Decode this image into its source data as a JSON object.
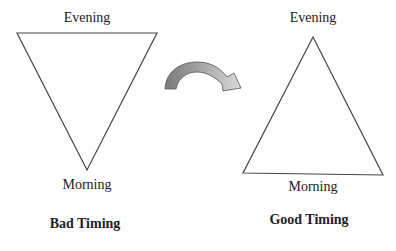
{
  "diagram": {
    "left": {
      "top_label": "Evening",
      "bottom_label": "Morning",
      "caption": "Bad Timing",
      "shape": "inverted-triangle"
    },
    "right": {
      "top_label": "Evening",
      "bottom_label": "Morning",
      "caption": "Good Timing",
      "shape": "upright-triangle"
    },
    "connector": {
      "icon": "curved-arrow-right",
      "colors": {
        "start": "#7a7a7a",
        "end": "#d4d4d4"
      }
    }
  }
}
